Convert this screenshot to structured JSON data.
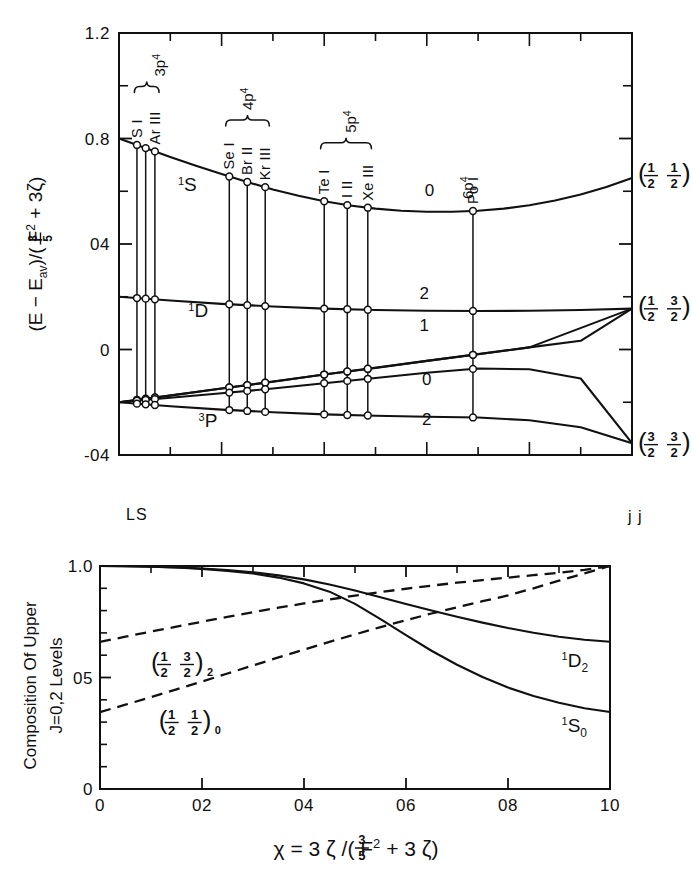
{
  "figure": {
    "regime_left_label": "LS",
    "regime_right_label": "j j"
  },
  "chart_data": [
    {
      "type": "line",
      "id": "energy-level-diagram",
      "title": "",
      "xlabel": "",
      "ylabel": "(E - E_av)/((3/5) F^2 + 3ζ)",
      "ylabel_parts": {
        "prefix": "(E − E",
        "sub": "av",
        "mid": ")/(",
        "frac_num": "3",
        "frac_den": "5",
        "f_symbol": "F",
        "f_sup": "2",
        "plus": "+ 3",
        "zeta": "ζ",
        "suffix": ")"
      },
      "xlim": [
        0,
        1.0
      ],
      "ylim": [
        -0.4,
        1.2
      ],
      "ytick_labels": [
        "1.2",
        "0.8",
        "04",
        "0",
        "-04"
      ],
      "ytick_values": [
        1.2,
        0.8,
        0.4,
        0.0,
        -0.4
      ],
      "yminor_values": [
        1.0,
        0.6,
        0.2,
        -0.2
      ],
      "xtick_values": [
        0,
        0.1,
        0.2,
        0.3,
        0.4,
        0.5,
        0.6,
        0.7,
        0.8,
        0.9,
        1.0
      ],
      "grid": false,
      "term_labels": [
        {
          "text": "S",
          "sup": "1",
          "x": 0.115,
          "y": 0.6
        },
        {
          "text": "D",
          "sup": "1",
          "x": 0.135,
          "y": 0.125
        },
        {
          "text": "P",
          "sup": "3",
          "x": 0.155,
          "y": -0.295
        }
      ],
      "j_labels": [
        {
          "text": "0",
          "x": 0.605,
          "y": 0.565
        },
        {
          "text": "2",
          "x": 0.595,
          "y": 0.175
        },
        {
          "text": "1",
          "x": 0.595,
          "y": 0.055
        },
        {
          "text": "0",
          "x": 0.6,
          "y": -0.15
        },
        {
          "text": "2",
          "x": 0.6,
          "y": -0.3
        }
      ],
      "jj_limit_labels": [
        {
          "left_num": "1",
          "left_den": "2",
          "right_num": "1",
          "right_den": "2",
          "y": 0.665
        },
        {
          "left_num": "1",
          "left_den": "2",
          "right_num": "3",
          "right_den": "2",
          "y": 0.16
        },
        {
          "left_num": "3",
          "left_den": "2",
          "right_num": "3",
          "right_den": "2",
          "y": -0.355
        }
      ],
      "series": [
        {
          "name": "1S0 → (1/2,1/2)0",
          "x": [
            0.0,
            0.05,
            0.1,
            0.15,
            0.2,
            0.25,
            0.3,
            0.35,
            0.4,
            0.45,
            0.5,
            0.55,
            0.6,
            0.65,
            0.7,
            0.75,
            0.8,
            0.85,
            0.9,
            0.95,
            1.0
          ],
          "values": [
            0.8,
            0.765,
            0.73,
            0.697,
            0.665,
            0.635,
            0.607,
            0.583,
            0.562,
            0.546,
            0.534,
            0.526,
            0.522,
            0.522,
            0.526,
            0.534,
            0.547,
            0.565,
            0.588,
            0.616,
            0.65
          ]
        },
        {
          "name": "1D2 → (1/2,3/2)2",
          "x": [
            0.0,
            0.1,
            0.2,
            0.3,
            0.4,
            0.5,
            0.6,
            0.7,
            0.8,
            0.9,
            1.0
          ],
          "values": [
            0.2,
            0.186,
            0.173,
            0.163,
            0.155,
            0.15,
            0.147,
            0.146,
            0.147,
            0.15,
            0.155
          ]
        },
        {
          "name": "3P2 → (1/2,3/2)2-upper",
          "x": [
            0.0,
            0.1,
            0.2,
            0.3,
            0.4,
            0.5,
            0.6,
            0.7,
            0.8,
            0.9,
            1.0
          ],
          "values": [
            -0.2,
            -0.175,
            -0.148,
            -0.122,
            -0.095,
            -0.07,
            -0.043,
            -0.018,
            0.008,
            0.033,
            0.155
          ]
        },
        {
          "name": "3P1 → (1/2,3/2)1",
          "x": [
            0.0,
            0.2,
            0.4,
            0.6,
            0.8,
            1.0
          ],
          "values": [
            -0.2,
            -0.148,
            -0.095,
            -0.043,
            0.008,
            0.155
          ]
        },
        {
          "name": "3P0 → (3/2,3/2)0",
          "x": [
            0.0,
            0.1,
            0.2,
            0.3,
            0.4,
            0.5,
            0.6,
            0.7,
            0.8,
            0.9,
            1.0
          ],
          "values": [
            -0.2,
            -0.183,
            -0.166,
            -0.148,
            -0.128,
            -0.108,
            -0.088,
            -0.072,
            -0.075,
            -0.11,
            -0.355
          ]
        },
        {
          "name": "3P2low → (3/2,3/2)2",
          "x": [
            0.0,
            0.1,
            0.2,
            0.3,
            0.4,
            0.5,
            0.6,
            0.7,
            0.8,
            0.9,
            1.0
          ],
          "values": [
            -0.2,
            -0.215,
            -0.228,
            -0.238,
            -0.246,
            -0.251,
            -0.255,
            -0.258,
            -0.268,
            -0.295,
            -0.355
          ]
        }
      ],
      "elements": [
        {
          "label": "S I",
          "x": 0.035,
          "config": "3p",
          "config_sup": "4",
          "group": 1
        },
        {
          "label": "",
          "x": 0.052,
          "config": "3p",
          "config_sup": "4",
          "group": 1
        },
        {
          "label": "Ar III",
          "x": 0.07,
          "config": "3p",
          "config_sup": "4",
          "group": 1
        },
        {
          "label": "Se I",
          "x": 0.215,
          "config": "4p",
          "config_sup": "4",
          "group": 2
        },
        {
          "label": "Br II",
          "x": 0.25,
          "config": "4p",
          "config_sup": "4",
          "group": 2
        },
        {
          "label": "Kr III",
          "x": 0.285,
          "config": "4p",
          "config_sup": "4",
          "group": 2
        },
        {
          "label": "Te I",
          "x": 0.4,
          "config": "5p",
          "config_sup": "4",
          "group": 3
        },
        {
          "label": "I II",
          "x": 0.445,
          "config": "5p",
          "config_sup": "4",
          "group": 3
        },
        {
          "label": "Xe III",
          "x": 0.485,
          "config": "5p",
          "config_sup": "4",
          "group": 3
        },
        {
          "label": "Po I",
          "x": 0.69,
          "config": "6p",
          "config_sup": "4",
          "group": 4
        }
      ],
      "config_groups": [
        {
          "config": "3p",
          "sup": "4",
          "x_start": 0.03,
          "x_end": 0.078,
          "label_x": 0.09
        },
        {
          "config": "4p",
          "sup": "4",
          "x_start": 0.208,
          "x_end": 0.293,
          "label_x": 0.262
        },
        {
          "config": "5p",
          "sup": "4",
          "x_start": 0.393,
          "x_end": 0.492,
          "label_x": 0.462
        },
        {
          "config": "6p",
          "sup": "4",
          "x_start": null,
          "x_end": null,
          "label_x": 0.69
        }
      ]
    },
    {
      "type": "line",
      "id": "composition-diagram",
      "title": "",
      "ylabel_line1": "Composition Of Upper",
      "ylabel_line2": "J=0,2  Levels",
      "xlabel_parts": {
        "chi": "χ",
        "equals": "= 3",
        "zeta1": "ζ",
        "slash": "/(",
        "frac_num": "3",
        "frac_den": "5",
        "f_symbol": "F",
        "f_sup": "2",
        "plus": "+ 3",
        "zeta2": "ζ",
        "close": ")"
      },
      "xlabel": "χ = 3ζ/((3/5)F^2 + 3ζ)",
      "ylabel": "Composition Of Upper J=0,2 Levels",
      "xlim": [
        0,
        1.0
      ],
      "ylim": [
        0,
        1.0
      ],
      "xtick_labels": [
        "0",
        "02",
        "04",
        "06",
        "08",
        "10"
      ],
      "xtick_values": [
        0,
        0.2,
        0.4,
        0.6,
        0.8,
        1.0
      ],
      "ytick_labels": [
        "1.0",
        "05",
        "0"
      ],
      "ytick_values": [
        1.0,
        0.5,
        0.0
      ],
      "yminor_values": [
        0.1,
        0.2,
        0.3,
        0.4,
        0.6,
        0.7,
        0.8,
        0.9
      ],
      "xminor_values": [
        0.1,
        0.3,
        0.5,
        0.7,
        0.9
      ],
      "grid": false,
      "series": [
        {
          "name": "1S0",
          "style": "solid",
          "x": [
            0.0,
            0.05,
            0.1,
            0.15,
            0.2,
            0.25,
            0.3,
            0.35,
            0.4,
            0.45,
            0.5,
            0.55,
            0.6,
            0.65,
            0.7,
            0.75,
            0.8,
            0.85,
            0.9,
            0.95,
            1.0
          ],
          "values": [
            1.0,
            0.999,
            0.997,
            0.993,
            0.987,
            0.978,
            0.966,
            0.948,
            0.922,
            0.885,
            0.83,
            0.762,
            0.69,
            0.62,
            0.557,
            0.502,
            0.455,
            0.417,
            0.387,
            0.362,
            0.345
          ]
        },
        {
          "name": "1D2",
          "style": "solid",
          "x": [
            0.0,
            0.05,
            0.1,
            0.15,
            0.2,
            0.25,
            0.3,
            0.35,
            0.4,
            0.45,
            0.5,
            0.55,
            0.6,
            0.65,
            0.7,
            0.75,
            0.8,
            0.85,
            0.9,
            0.95,
            1.0
          ],
          "values": [
            1.0,
            0.999,
            0.997,
            0.994,
            0.989,
            0.982,
            0.972,
            0.958,
            0.94,
            0.917,
            0.89,
            0.86,
            0.83,
            0.8,
            0.772,
            0.746,
            0.722,
            0.701,
            0.683,
            0.669,
            0.66
          ]
        },
        {
          "name": "(1/2 3/2)2",
          "style": "dashed",
          "x": [
            0.0,
            0.05,
            0.1,
            0.15,
            0.2,
            0.25,
            0.3,
            0.35,
            0.4,
            0.45,
            0.5,
            0.55,
            0.6,
            0.65,
            0.7,
            0.75,
            0.8,
            0.85,
            0.9,
            0.95,
            1.0
          ],
          "values": [
            0.66,
            0.683,
            0.706,
            0.728,
            0.75,
            0.772,
            0.793,
            0.813,
            0.832,
            0.85,
            0.867,
            0.883,
            0.898,
            0.912,
            0.925,
            0.937,
            0.948,
            0.959,
            0.97,
            0.983,
            1.0
          ]
        },
        {
          "name": "(1/2 1/2)0",
          "style": "dashed",
          "x": [
            0.0,
            0.05,
            0.1,
            0.15,
            0.2,
            0.25,
            0.3,
            0.35,
            0.4,
            0.45,
            0.5,
            0.55,
            0.6,
            0.65,
            0.7,
            0.75,
            0.8,
            0.85,
            0.9,
            0.95,
            1.0
          ],
          "values": [
            0.345,
            0.378,
            0.412,
            0.447,
            0.482,
            0.518,
            0.554,
            0.59,
            0.625,
            0.66,
            0.693,
            0.726,
            0.757,
            0.787,
            0.815,
            0.842,
            0.868,
            0.9,
            0.934,
            0.967,
            1.0
          ]
        }
      ],
      "annotations": [
        {
          "id": "jj-2-label",
          "left_num": "1",
          "left_den": "2",
          "right_num": "3",
          "right_den": "2",
          "sub": "2",
          "x": 0.1,
          "y": 0.565
        },
        {
          "id": "jj-0-label",
          "left_num": "1",
          "left_den": "2",
          "right_num": "1",
          "right_den": "2",
          "sub": "0",
          "x": 0.115,
          "y": 0.305
        },
        {
          "id": "1D2-label",
          "text": "D",
          "sup": "1",
          "sub": "2",
          "x": 0.905,
          "y": 0.545
        },
        {
          "id": "1S0-label",
          "text": "S",
          "sup": "1",
          "sub": "0",
          "x": 0.905,
          "y": 0.255
        }
      ]
    }
  ]
}
